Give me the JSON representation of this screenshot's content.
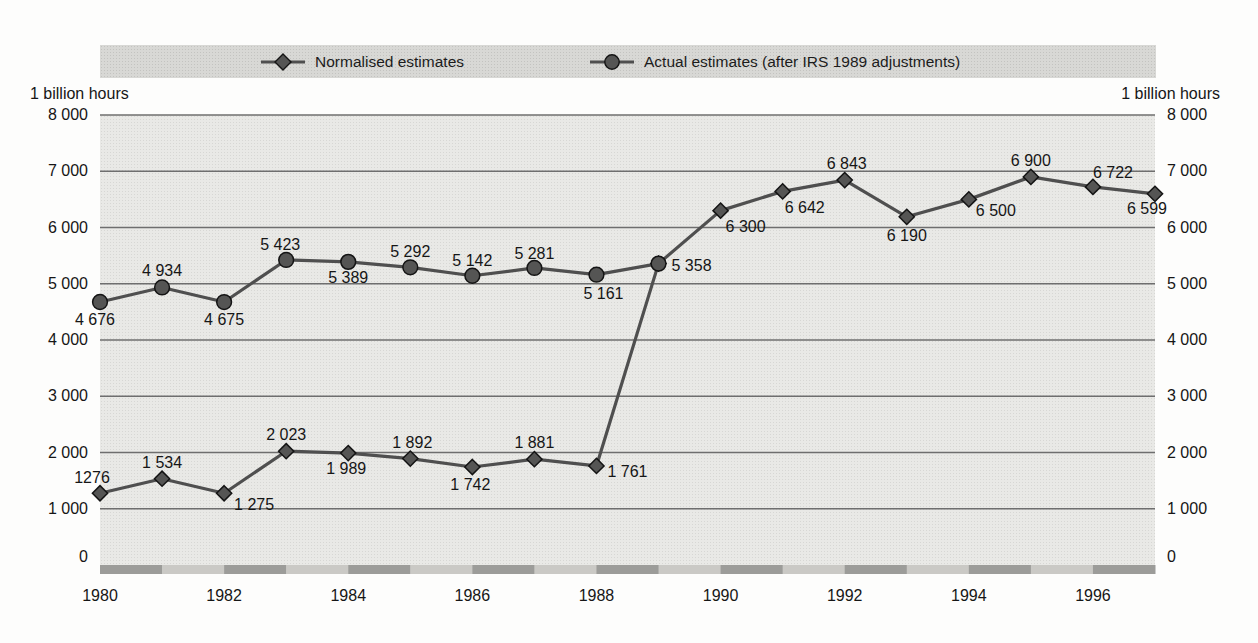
{
  "legend": {
    "items": [
      {
        "label": "Normalised estimates",
        "marker": "diamond"
      },
      {
        "label": "Actual estimates (after IRS 1989 adjustments)",
        "marker": "circle"
      }
    ]
  },
  "axes": {
    "unit_left": "1 billion hours",
    "unit_right": "1 billion hours",
    "y_tick_values": [
      8000,
      7000,
      6000,
      5000,
      4000,
      3000,
      2000,
      1000,
      0
    ],
    "y_tick_labels": [
      "8 000",
      "7 000",
      "6 000",
      "5 000",
      "4 000",
      "3 000",
      "2 000",
      "1 000",
      "0"
    ],
    "x_tick_years": [
      1980,
      1982,
      1984,
      1986,
      1988,
      1990,
      1992,
      1994,
      1996
    ],
    "x_tick_labels": [
      "1980",
      "1982",
      "1984",
      "1986",
      "1988",
      "1990",
      "1992",
      "1994",
      "1996"
    ]
  },
  "chart_data": {
    "type": "line",
    "title": "",
    "xlabel": "",
    "ylabel": "1 billion hours",
    "x_years": [
      1980,
      1981,
      1982,
      1983,
      1984,
      1985,
      1986,
      1987,
      1988,
      1989,
      1990,
      1991,
      1992,
      1993,
      1994,
      1995,
      1996,
      1997
    ],
    "ylim": [
      0,
      8000
    ],
    "grid": true,
    "legend_position": "top",
    "series": [
      {
        "name": "Normalised estimates",
        "marker": "diamond",
        "start_year": 1980,
        "values": [
          1276,
          1534,
          1275,
          2023,
          1989,
          1892,
          1742,
          1881,
          1761,
          5358,
          6300,
          6642,
          6843,
          6190,
          6500,
          6900,
          6722,
          6599
        ],
        "labels": [
          "1276",
          "1 534",
          "1 275",
          "2 023",
          "1 989",
          "1 892",
          "1 742",
          "1 881",
          "1 761",
          null,
          "6 300",
          "6 642",
          "6 843",
          "6 190",
          "6 500",
          "6 900",
          "6 722",
          "6 599"
        ],
        "label_offsets": [
          [
            -8,
            -10,
            "m"
          ],
          [
            0,
            -11,
            "m"
          ],
          [
            10,
            17,
            "s"
          ],
          [
            0,
            -11,
            "m"
          ],
          [
            -2,
            21,
            "m"
          ],
          [
            2,
            -11,
            "m"
          ],
          [
            -2,
            23,
            "m"
          ],
          [
            0,
            -11,
            "m"
          ],
          [
            11,
            11,
            "s"
          ],
          null,
          [
            5,
            21,
            "s"
          ],
          [
            2,
            22,
            "s"
          ],
          [
            2,
            -11,
            "m"
          ],
          [
            0,
            24,
            "m"
          ],
          [
            7,
            17,
            "s"
          ],
          [
            0,
            -11,
            "m"
          ],
          [
            20,
            -9,
            "m"
          ],
          [
            12,
            20,
            "e"
          ]
        ]
      },
      {
        "name": "Actual estimates (after IRS 1989 adjustments)",
        "marker": "circle",
        "start_year": 1980,
        "values": [
          4676,
          4934,
          4675,
          5423,
          5389,
          5292,
          5142,
          5281,
          5161,
          5358
        ],
        "labels": [
          "4 676",
          "4 934",
          "4 675",
          "5 423",
          "5 389",
          "5 292",
          "5 142",
          "5 281",
          "5 161",
          "5 358"
        ],
        "label_offsets": [
          [
            -5,
            23,
            "m"
          ],
          [
            0,
            -11,
            "m"
          ],
          [
            0,
            23,
            "m"
          ],
          [
            -6,
            -10,
            "m"
          ],
          [
            0,
            21,
            "m"
          ],
          [
            0,
            -10,
            "m"
          ],
          [
            0,
            -10,
            "m"
          ],
          [
            0,
            -9,
            "m"
          ],
          [
            7,
            24,
            "m"
          ],
          [
            13,
            7,
            "s"
          ]
        ]
      }
    ],
    "colors": {
      "line": "#4f4f4f",
      "marker_fill": "#555554",
      "marker_stroke": "#141414",
      "gridline": "#6e6e6e",
      "label_text": "#161616",
      "plot_bg": "#e9e9e6",
      "legend_band_bg": "#d8d8d5",
      "band_dark": "#9c9c99",
      "band_light": "#cac9c5"
    }
  }
}
